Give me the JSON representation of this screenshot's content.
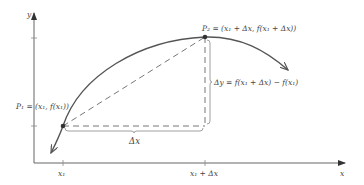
{
  "diagram": {
    "axes": {
      "x_label": "x",
      "y_label": "y"
    },
    "ticks": {
      "x1": "x₁",
      "x1_plus_dx": "x₁ + Δx"
    },
    "points": {
      "p1_label": "P₁ = (x₁, f(x₁))",
      "p2_label": "P₂ = (x₁ + Δx, f(x₁ + Δx))"
    },
    "annotations": {
      "delta_x": "Δx",
      "delta_y": "Δy = f(x₁ + Δx) − f(x₁)"
    },
    "colors": {
      "curve": "#555555",
      "axes": "#666666",
      "dashed": "#777777",
      "point": "#333333"
    }
  }
}
